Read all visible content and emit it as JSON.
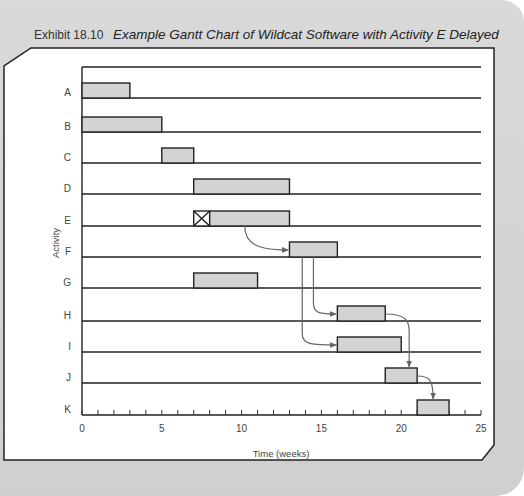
{
  "title": {
    "exhibit": "Exhibit 18.10",
    "caption": "Example Gantt Chart of Wildcat Software with Activity E Delayed"
  },
  "chart_data": {
    "type": "gantt",
    "title": "Example Gantt Chart of Wildcat Software with Activity E Delayed",
    "xlabel": "Time (weeks)",
    "ylabel": "Activity",
    "xlim": [
      0,
      25
    ],
    "x_ticks": [
      0,
      5,
      10,
      15,
      20,
      25
    ],
    "minor_tick_step": 1,
    "grid": false,
    "activities": [
      {
        "name": "A",
        "start": 0,
        "end": 3
      },
      {
        "name": "B",
        "start": 0,
        "end": 5
      },
      {
        "name": "C",
        "start": 5,
        "end": 7
      },
      {
        "name": "D",
        "start": 7,
        "end": 13
      },
      {
        "name": "E",
        "start": 8,
        "end": 13,
        "delay_start": 7,
        "delay_end": 8,
        "delayed": true
      },
      {
        "name": "F",
        "start": 13,
        "end": 16
      },
      {
        "name": "G",
        "start": 7,
        "end": 11
      },
      {
        "name": "H",
        "start": 16,
        "end": 19
      },
      {
        "name": "I",
        "start": 16,
        "end": 20
      },
      {
        "name": "J",
        "start": 19,
        "end": 21
      },
      {
        "name": "K",
        "start": 21,
        "end": 23
      }
    ],
    "dependency_arrows": [
      {
        "from": "E",
        "to": "F"
      },
      {
        "from": "F",
        "to": "H"
      },
      {
        "from": "F",
        "to": "I"
      },
      {
        "from": "H",
        "to": "J"
      },
      {
        "from": "I",
        "to": "J"
      },
      {
        "from": "J",
        "to": "K"
      }
    ],
    "bar_color": "#d3d3d3",
    "line_color": "#222222",
    "arrow_color": "#666666"
  }
}
